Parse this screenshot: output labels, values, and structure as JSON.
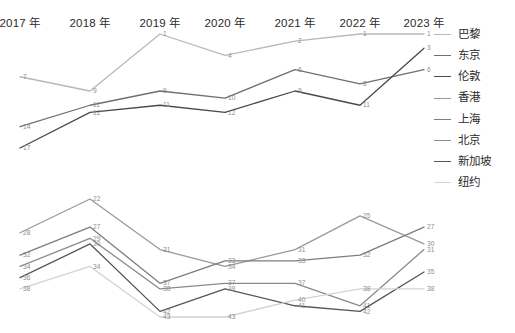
{
  "axis": {
    "ticks": [
      "2017 年",
      "2018 年",
      "2019 年",
      "2020 年",
      "2021 年",
      "2022 年",
      "2023 年"
    ]
  },
  "legend": {
    "items": [
      {
        "label": "巴黎",
        "color": "#b8b8b8"
      },
      {
        "label": "东京",
        "color": "#6f6f6f"
      },
      {
        "label": "伦敦",
        "color": "#4a4a4a"
      },
      {
        "label": "香港",
        "color": "#9a9a9a"
      },
      {
        "label": "上海",
        "color": "#7d7d7d"
      },
      {
        "label": "北京",
        "color": "#8a8a8a"
      },
      {
        "label": "新加坡",
        "color": "#555555"
      },
      {
        "label": "纽约",
        "color": "#d2d2d2"
      }
    ]
  },
  "chart_data": {
    "type": "line",
    "title": "",
    "xlabel": "",
    "ylabel": "",
    "x": [
      "2017 年",
      "2018 年",
      "2019 年",
      "2020 年",
      "2021 年",
      "2022 年",
      "2023 年"
    ],
    "note": "Ranking chart: smaller value = higher rank, y axis inverted. Two stacked panels share the same x axis.",
    "panels": [
      {
        "name": "top-panel",
        "ylim": [
          1,
          17
        ],
        "inverted": true,
        "series": [
          {
            "name": "巴黎",
            "color": "#b8b8b8",
            "values": [
              7,
              9,
              1,
              4,
              2,
              1,
              1
            ]
          },
          {
            "name": "东京",
            "color": "#6f6f6f",
            "values": [
              14,
              11,
              9,
              10,
              6,
              8,
              6
            ]
          },
          {
            "name": "伦敦",
            "color": "#4a4a4a",
            "values": [
              17,
              12,
              11,
              12,
              9,
              11,
              3
            ]
          }
        ]
      },
      {
        "name": "bottom-panel",
        "ylim": [
          22,
          43
        ],
        "inverted": true,
        "series": [
          {
            "name": "香港",
            "color": "#9a9a9a",
            "values": [
              28,
              22,
              31,
              34,
              31,
              25,
              30
            ]
          },
          {
            "name": "上海",
            "color": "#7d7d7d",
            "values": [
              32,
              27,
              37,
              33,
              33,
              32,
              27
            ]
          },
          {
            "name": "北京",
            "color": "#8a8a8a",
            "values": [
              34,
              29,
              38,
              37,
              37,
              41,
              31
            ]
          },
          {
            "name": "新加坡",
            "color": "#555555",
            "values": [
              36,
              30,
              42,
              38,
              41,
              42,
              35
            ]
          },
          {
            "name": "纽约",
            "color": "#d2d2d2",
            "values": [
              38,
              34,
              43,
              43,
              40,
              38,
              38
            ]
          }
        ]
      }
    ]
  }
}
